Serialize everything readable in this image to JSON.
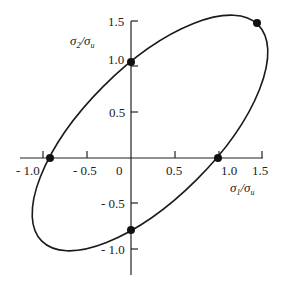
{
  "diagram": {
    "type": "failure-envelope-ellipse",
    "x_axis": {
      "label_main": "σ",
      "label_sub1": "1",
      "label_slash": "/σ",
      "label_sub2": "u",
      "ticks": [
        {
          "value": -1.0,
          "label": "- 1.0"
        },
        {
          "value": -0.5,
          "label": "- 0.5"
        },
        {
          "value": 0,
          "label": "0"
        },
        {
          "value": 0.5,
          "label": "0.5"
        },
        {
          "value": 1.0,
          "label": "1.0"
        },
        {
          "value": 1.5,
          "label": "1.5"
        }
      ]
    },
    "y_axis": {
      "label_main": "σ",
      "label_sub1": "2",
      "label_slash": "/σ",
      "label_sub2": "u",
      "ticks": [
        {
          "value": 1.5,
          "label": "1.5"
        },
        {
          "value": 1.0,
          "label": "1.0"
        },
        {
          "value": 0.5,
          "label": "0.5"
        },
        {
          "value": -0.5,
          "label": "- 0.5"
        },
        {
          "value": -1.0,
          "label": "- 1.0"
        }
      ]
    },
    "points": [
      {
        "name": "y-intercept-top",
        "x": 0,
        "y": 1.0
      },
      {
        "name": "biaxial-equal",
        "x": 1.45,
        "y": 1.45
      },
      {
        "name": "x-intercept-right",
        "x": 0.9,
        "y": 0
      },
      {
        "name": "x-intercept-left",
        "x": -0.87,
        "y": 0
      },
      {
        "name": "y-intercept-bottom",
        "x": 0,
        "y": -0.77
      }
    ],
    "curve": {
      "shape": "ellipse",
      "rotation_deg": 45,
      "stroke": "#1a1a1a"
    }
  }
}
